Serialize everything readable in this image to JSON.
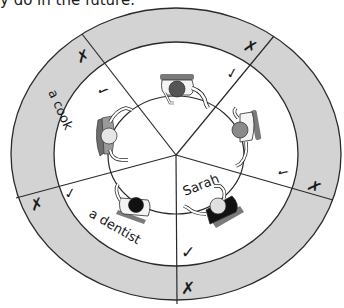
{
  "header": {
    "partial_text": "y do in the future."
  },
  "diagram": {
    "colors": {
      "ring_fill": "#d3d3d3",
      "inner_fill": "#ffffff",
      "line": "#2a2a2a",
      "chair_dark": "#6e6e6e",
      "chair_light": "#9a9a9a"
    },
    "ring_labels": {
      "cook": "a cook",
      "dentist": "a dentist"
    },
    "inner_labels": {
      "sarah": "Sarah"
    },
    "ring_marks": {
      "top_left": "✗",
      "top_right": "✗",
      "right": "✗",
      "bottom": "✗",
      "left": "✗"
    },
    "inner_marks": {
      "top_left": "✓",
      "top_right": "✓",
      "right": "✓",
      "bottom": "✓",
      "left": "✓"
    },
    "people": [
      {
        "position": "top",
        "head_color": "#555555"
      },
      {
        "position": "right",
        "head_color": "#8a8a8a"
      },
      {
        "position": "bottom-right",
        "name": "Sarah",
        "head_color": "#e0e0e0",
        "body_color": "#111111"
      },
      {
        "position": "bottom-left",
        "head_color": "#111111"
      },
      {
        "position": "left",
        "head_color": "#e6e6e6"
      }
    ]
  }
}
